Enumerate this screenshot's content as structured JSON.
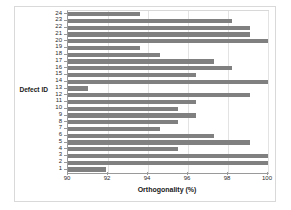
{
  "chart_data": {
    "type": "bar",
    "orientation": "horizontal",
    "title": "",
    "xlabel": "Orthogonality (%)",
    "ylabel": "Defect ID",
    "xlim": [
      90,
      100
    ],
    "xticks": [
      90,
      92,
      94,
      96,
      98,
      100
    ],
    "xtick_labels": [
      "90",
      "92",
      "94",
      "96",
      "98",
      "100"
    ],
    "grid": false,
    "legend": null,
    "bar_color": "#808080",
    "categories": [
      "1",
      "2",
      "3",
      "4",
      "5",
      "6",
      "7",
      "8",
      "9",
      "10",
      "11",
      "12",
      "13",
      "14",
      "15",
      "16",
      "17",
      "18",
      "19",
      "20",
      "21",
      "22",
      "23",
      "24"
    ],
    "values": [
      91.9,
      100.0,
      100.0,
      95.5,
      99.1,
      97.3,
      94.6,
      95.5,
      96.4,
      95.5,
      96.4,
      99.1,
      91.0,
      100.0,
      96.4,
      98.2,
      97.3,
      94.6,
      93.6,
      100.0,
      99.1,
      99.1,
      98.2,
      93.6
    ],
    "series_name": "Orthogonality"
  },
  "axes": {
    "y_title": "Defect ID",
    "x_title": "Orthogonality (%)"
  }
}
